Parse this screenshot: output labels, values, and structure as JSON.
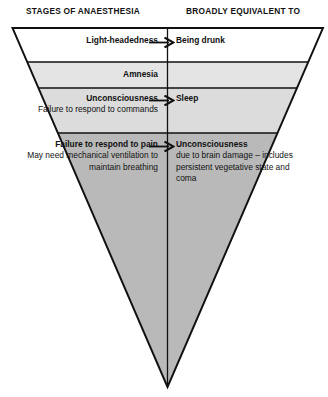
{
  "headers": {
    "left": "STAGES OF ANAESTHESIA",
    "right": "BROADLY EQUIVALENT TO"
  },
  "colors": {
    "band_1": "#ffffff",
    "band_2": "#e4e4e4",
    "band_3": "#dcdcdc",
    "band_4": "#b9b9b9",
    "outline": "#111111",
    "text": "#111111"
  },
  "diagram": {
    "shape": "inverted-triangle-funnel",
    "apex_label": "",
    "bands": [
      {
        "index": 1,
        "fill": "#ffffff",
        "left_title": "Light-headedness",
        "left_detail": "",
        "has_arrow": true,
        "right_title": "Being drunk",
        "right_detail": ""
      },
      {
        "index": 2,
        "fill": "#e4e4e4",
        "left_title": "Amnesia",
        "left_detail": "",
        "has_arrow": false,
        "right_title": "",
        "right_detail": ""
      },
      {
        "index": 3,
        "fill": "#dcdcdc",
        "left_title": "Unconsciousness",
        "left_detail": "Failure to respond to commands",
        "has_arrow": true,
        "right_title": "Sleep",
        "right_detail": ""
      },
      {
        "index": 4,
        "fill": "#b9b9b9",
        "left_title": "Failure to respond to pain",
        "left_detail": "May need mechanical ventilation to maintain breathing",
        "has_arrow": true,
        "right_title": "Unconsciousness",
        "right_detail": "due to brain damage – includes persistent vegetative state and coma"
      }
    ]
  }
}
